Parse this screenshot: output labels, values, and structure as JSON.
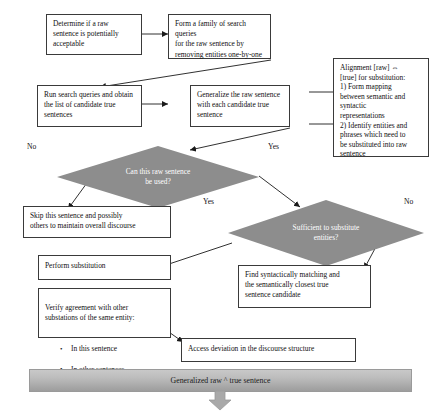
{
  "diagram": {
    "colors": {
      "box_border": "#3a3a3a",
      "box_fill": "#ffffff",
      "diamond_fill": "#8d8d8d",
      "diamond_text": "#ffffff",
      "banner_fill": "#b8b8b8",
      "connector": "#1a1a1a"
    },
    "nodes": {
      "determine": "Determine if a raw\nsentence is potentially\nacceptable",
      "form_family": "Form a family of search queries\nfor the raw sentence by\nremoving entities one-by-one",
      "run_search": "Run search queries and obtain\nthe list of candidate true\nsentences",
      "generalize": "Generalize the raw sentence\nwith each candidate true\nsentence",
      "alignment": "Alignment [raw] ⇔\n[true] for substitution:\n1) Form mapping\nbetween semantic and\nsyntactic\nrepresentations\n2) Identify entities and\nphrases which need to\nbe substituted into raw\nsentence",
      "skip": "Skip this sentence and possibly\nothers to maintain overall discourse",
      "perform_substitution": "Perform substitution",
      "verify_heading": "Verify agreement with other\nsubstations of the same entity:",
      "verify_bullets": [
        "In this sentence",
        "In other sentences"
      ],
      "find_syntactic": "Find syntactically matching and\nthe semantically closest true\nsentence candidate",
      "access_deviation": "Access deviation in the discourse structure"
    },
    "decisions": {
      "can_be_used": "Can this raw sentence\nbe used?",
      "sufficient": "Sufficient to substitute\nentities?"
    },
    "edge_labels": {
      "can_no": "No",
      "can_yes": "Yes",
      "suff_yes": "Yes",
      "suff_no": "No"
    },
    "banner": {
      "label": "Generalized raw ^ true sentence"
    }
  }
}
